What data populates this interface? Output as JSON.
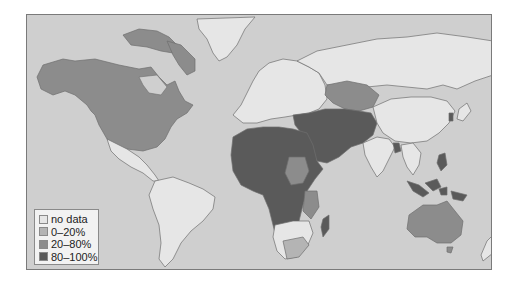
{
  "map": {
    "type": "choropleth-world",
    "colors": {
      "ocean": "#cfcfcf",
      "no_data": "#e6e6e6",
      "low": "#b4b4b4",
      "mid": "#8c8c8c",
      "high": "#5a5a5a",
      "border": "#6e6e6e"
    }
  },
  "legend": {
    "items": [
      {
        "label": "no data",
        "color": "#e6e6e6"
      },
      {
        "label": "0–20%",
        "color": "#b4b4b4"
      },
      {
        "label": "20–80%",
        "color": "#8c8c8c"
      },
      {
        "label": "80–100%",
        "color": "#5a5a5a"
      }
    ]
  }
}
